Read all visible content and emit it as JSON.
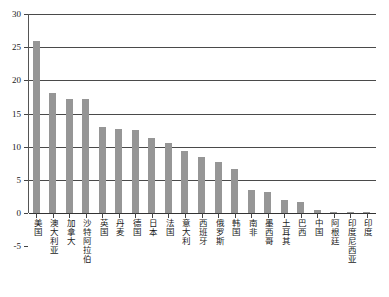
{
  "chart_data": {
    "type": "bar",
    "title": "",
    "subtitle": "",
    "xlabel": "",
    "ylabel": "",
    "ylim": [
      -5,
      30
    ],
    "yticks": [
      -5,
      0,
      5,
      10,
      15,
      20,
      25,
      30
    ],
    "ytick_labels": [
      "-5",
      "0",
      "5",
      "10",
      "15",
      "20",
      "25",
      "30"
    ],
    "grid": true,
    "legend": null,
    "bar_color": "#969696",
    "axis_color": "#444444",
    "categories": [
      "美国",
      "澳大利亚",
      "加拿大",
      "沙特阿拉伯",
      "英国",
      "丹麦",
      "德国",
      "日本",
      "法国",
      "意大利",
      "西班牙",
      "俄罗斯",
      "韩国",
      "南非",
      "墨西哥",
      "土耳其",
      "巴西",
      "中国",
      "阿根廷",
      "印度尼西亚",
      "印度"
    ],
    "values": [
      26.0,
      18.1,
      17.2,
      17.2,
      12.9,
      12.7,
      12.5,
      11.3,
      10.6,
      9.3,
      8.4,
      7.7,
      6.7,
      3.5,
      3.1,
      2.0,
      1.6,
      0.4,
      0.1,
      0.1,
      0.1
    ]
  }
}
